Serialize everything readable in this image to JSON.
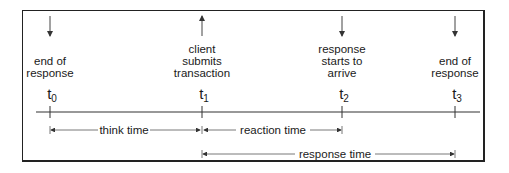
{
  "diagram": {
    "type": "timeline",
    "events": [
      {
        "id": "t0",
        "tick": "t",
        "sub": "0",
        "x": 50,
        "label_lines": [
          "end of",
          "response"
        ],
        "arrow": "down"
      },
      {
        "id": "t1",
        "tick": "t",
        "sub": "1",
        "x": 202,
        "label_lines": [
          "client",
          "submits",
          "transaction"
        ],
        "arrow": "up"
      },
      {
        "id": "t2",
        "tick": "t",
        "sub": "2",
        "x": 342,
        "label_lines": [
          "response",
          "starts to",
          "arrive"
        ],
        "arrow": "down"
      },
      {
        "id": "t3",
        "tick": "t",
        "sub": "3",
        "x": 455,
        "label_lines": [
          "end of",
          "response"
        ],
        "arrow": "down"
      }
    ],
    "intervals": [
      {
        "label": "think time",
        "from": "t0",
        "to": "t1"
      },
      {
        "label": "reaction time",
        "from": "t1",
        "to": "t2"
      },
      {
        "label": "response time",
        "from": "t1",
        "to": "t3"
      }
    ]
  }
}
